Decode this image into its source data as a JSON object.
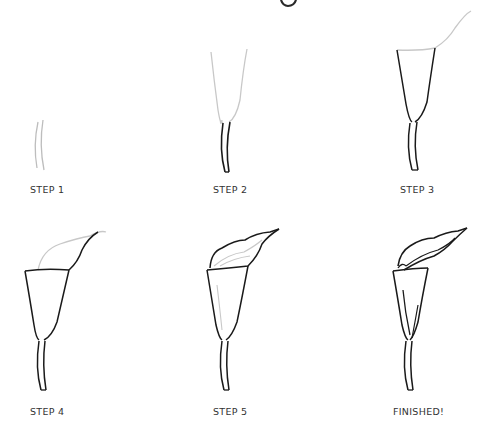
{
  "title_fragment": "g",
  "steps": [
    {
      "label": "STEP 1"
    },
    {
      "label": "STEP 2"
    },
    {
      "label": "STEP 3"
    },
    {
      "label": "STEP 4"
    },
    {
      "label": "STEP 5"
    },
    {
      "label": "FINISHED!"
    }
  ],
  "colors": {
    "ink": "#1a1a1a",
    "guide": "#c8c8c8",
    "background": "#ffffff",
    "label": "#333333"
  }
}
